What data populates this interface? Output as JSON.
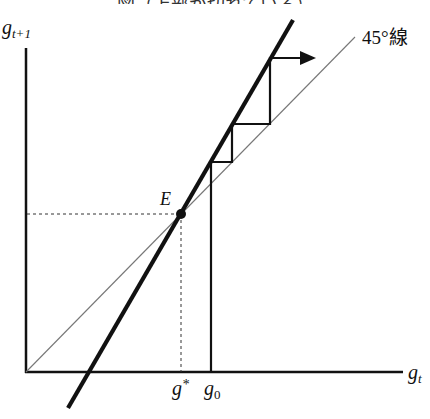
{
  "figure": {
    "title_partial": "図（上部が切れている）",
    "y_axis_label": {
      "base": "g",
      "sub": "t+1"
    },
    "x_axis_label": {
      "base": "g",
      "sub": "t"
    },
    "line_45_label": "45°線",
    "equilibrium_label": "E",
    "g_star_label": {
      "base": "g",
      "sup": "*"
    },
    "g0_label": {
      "base": "g",
      "sub": "0"
    }
  },
  "geometry": {
    "origin": [
      26,
      372
    ],
    "y_axis_top": [
      26,
      48
    ],
    "x_axis_end": [
      403,
      372
    ],
    "line_45": {
      "from": [
        26,
        372
      ],
      "to": [
        355,
        37
      ]
    },
    "steep_line": {
      "from": [
        68,
        408
      ],
      "to": [
        293,
        20
      ]
    },
    "equilibrium_point": [
      181,
      214
    ],
    "staircase": [
      [
        211,
        372
      ],
      [
        211,
        162
      ],
      [
        232,
        162
      ],
      [
        232,
        124
      ],
      [
        270,
        124
      ],
      [
        270,
        58
      ],
      [
        300,
        58
      ]
    ],
    "arrow_tip": [
      315,
      58
    ]
  },
  "colors": {
    "line": "#111111",
    "thin_line": "#777777",
    "background": "#ffffff"
  }
}
